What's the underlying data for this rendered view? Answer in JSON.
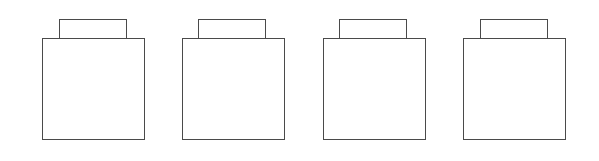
{
  "diagram": {
    "stroke_color": "#4a4a4a",
    "background": "#ffffff",
    "shapes": [
      {
        "id": "container-1",
        "box": {
          "x": 42,
          "y": 38,
          "w": 103,
          "h": 102
        },
        "tab": {
          "x": 59,
          "y": 19,
          "w": 68,
          "h": 19
        }
      },
      {
        "id": "container-2",
        "box": {
          "x": 182,
          "y": 38,
          "w": 103,
          "h": 102
        },
        "tab": {
          "x": 198,
          "y": 19,
          "w": 68,
          "h": 19
        }
      },
      {
        "id": "container-3",
        "box": {
          "x": 323,
          "y": 38,
          "w": 103,
          "h": 102
        },
        "tab": {
          "x": 339,
          "y": 19,
          "w": 68,
          "h": 19
        }
      },
      {
        "id": "container-4",
        "box": {
          "x": 463,
          "y": 38,
          "w": 103,
          "h": 102
        },
        "tab": {
          "x": 480,
          "y": 19,
          "w": 68,
          "h": 19
        }
      }
    ]
  }
}
